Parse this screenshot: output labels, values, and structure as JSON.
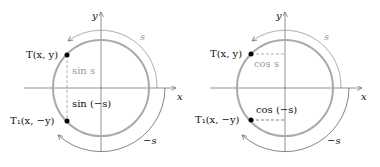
{
  "left": {
    "axis_x": "x",
    "axis_y": "y",
    "arc_pos": "s",
    "arc_neg": "−s",
    "point_top": "T(x, y)",
    "point_bottom": "T₁(x, −y)",
    "seg_top": "sin s",
    "seg_bottom": "sin (−s)"
  },
  "right": {
    "axis_x": "x",
    "axis_y": "y",
    "arc_pos": "s",
    "arc_neg": "−s",
    "point_top": "T(x, y)",
    "point_bottom": "T₁(x, −y)",
    "seg_top": "cos s",
    "seg_bottom": "cos (−s)"
  },
  "colors": {
    "circle": "#aaaaaa",
    "axis": "#666666",
    "arc": "#999999"
  }
}
